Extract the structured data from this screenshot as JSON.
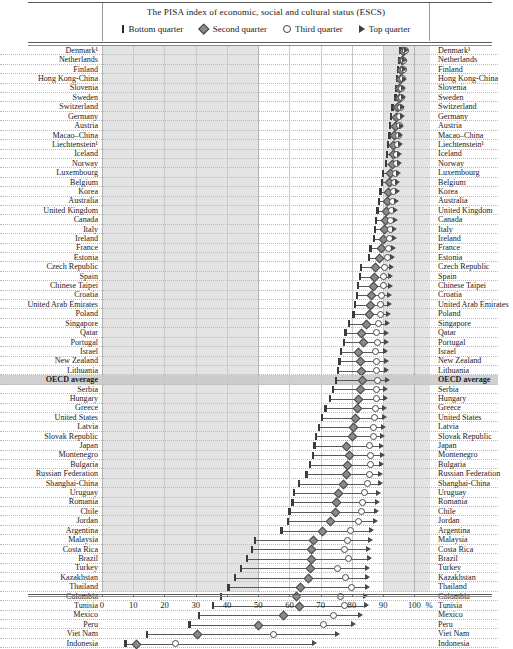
{
  "header": {
    "title": "The PISA index of economic, social and cultural status (ESCS)",
    "legend": [
      {
        "key": "bottom",
        "label": "Bottom quarter",
        "glyph": "bar-marker-icon"
      },
      {
        "key": "second",
        "label": "Second quarter",
        "glyph": "diamond-marker-icon"
      },
      {
        "key": "third",
        "label": "Third quarter",
        "glyph": "circle-marker-icon"
      },
      {
        "key": "top",
        "label": "Top quarter",
        "glyph": "triangle-marker-icon"
      }
    ]
  },
  "axis": {
    "ticks": [
      0,
      10,
      20,
      30,
      40,
      50,
      60,
      70,
      80,
      90,
      100
    ],
    "unit": "%",
    "min": 0,
    "max": 105,
    "shaded_bands": [
      [
        0,
        50
      ],
      [
        90,
        105
      ]
    ]
  },
  "colors": {
    "band_shade": "#e3e3e3",
    "highlight_row": "#c8c8c8",
    "marker_dark": "#4a4a4a",
    "marker_fill": "#8a8a8a",
    "grid": "#c9c9c9"
  },
  "chart_data": {
    "type": "scatter",
    "title": "The PISA index of economic, social and cultural status (ESCS)",
    "xlabel": "%",
    "ylabel": "",
    "xlim": [
      0,
      105
    ],
    "grid": true,
    "legend_position": "top",
    "series": [
      {
        "name": "Bottom quarter",
        "marker": "bar"
      },
      {
        "name": "Second quarter",
        "marker": "diamond"
      },
      {
        "name": "Third quarter",
        "marker": "circle"
      },
      {
        "name": "Top quarter",
        "marker": "triangle"
      }
    ],
    "categories": [
      "Denmark¹",
      "Netherlands",
      "Finland",
      "Hong Kong-China",
      "Slovenia",
      "Sweden",
      "Switzerland",
      "Germany",
      "Austria",
      "Macao–China",
      "Liechtenstein¹",
      "Iceland",
      "Norway",
      "Luxembourg",
      "Belgium",
      "Korea",
      "Australia",
      "United Kingdom",
      "Canada",
      "Italy",
      "Ireland",
      "France",
      "Estonia",
      "Czech Republic",
      "Spain",
      "Chinese Taipei",
      "Croatia",
      "United Arab Emirates",
      "Poland",
      "Singapore",
      "Qatar",
      "Portugal",
      "Israel",
      "New Zealand",
      "Lithuania",
      "OECD average",
      "Serbia",
      "Hungary",
      "Greece",
      "United States",
      "Latvia",
      "Slovak Republic",
      "Japan",
      "Montenegro",
      "Bulgaria",
      "Russian Federation",
      "Shanghai-China",
      "Uruguay",
      "Romania",
      "Chile",
      "Jordan",
      "Argentina",
      "Malaysia",
      "Costa Rica",
      "Brazil",
      "Turkey",
      "Kazakhstan",
      "Thailand",
      "Colombia",
      "Tunisia",
      "Mexico",
      "Peru",
      "Viet Nam",
      "Indonesia"
    ],
    "rows": [
      {
        "category": "Denmark¹",
        "bottom": 95.5,
        "second": 96.5,
        "third": 97.0,
        "top": 97.5
      },
      {
        "category": "Netherlands",
        "bottom": 95.0,
        "second": 96.0,
        "third": 96.5,
        "top": 97.0
      },
      {
        "category": "Finland",
        "bottom": 94.8,
        "second": 95.8,
        "third": 96.4,
        "top": 97.0
      },
      {
        "category": "Hong Kong-China",
        "bottom": 94.5,
        "second": 95.5,
        "third": 96.2,
        "top": 96.8
      },
      {
        "category": "Slovenia",
        "bottom": 94.2,
        "second": 95.2,
        "third": 96.0,
        "top": 96.6
      },
      {
        "category": "Sweden",
        "bottom": 94.0,
        "second": 95.0,
        "third": 95.8,
        "top": 96.5
      },
      {
        "category": "Switzerland",
        "bottom": 93.0,
        "second": 94.5,
        "third": 95.5,
        "top": 96.3
      },
      {
        "category": "Germany",
        "bottom": 92.6,
        "second": 94.2,
        "third": 95.3,
        "top": 96.2
      },
      {
        "category": "Austria",
        "bottom": 92.2,
        "second": 93.9,
        "third": 95.1,
        "top": 96.0
      },
      {
        "category": "Macao–China",
        "bottom": 92.0,
        "second": 93.6,
        "third": 94.8,
        "top": 95.8
      },
      {
        "category": "Liechtenstein¹",
        "bottom": 91.6,
        "second": 93.3,
        "third": 94.6,
        "top": 95.6
      },
      {
        "category": "Iceland",
        "bottom": 91.2,
        "second": 93.0,
        "third": 94.4,
        "top": 95.4
      },
      {
        "category": "Norway",
        "bottom": 91.0,
        "second": 92.8,
        "third": 94.2,
        "top": 95.2
      },
      {
        "category": "Luxembourg",
        "bottom": 90.0,
        "second": 92.2,
        "third": 93.8,
        "top": 95.0
      },
      {
        "category": "Belgium",
        "bottom": 89.6,
        "second": 91.8,
        "third": 93.5,
        "top": 94.8
      },
      {
        "category": "Korea",
        "bottom": 89.2,
        "second": 91.5,
        "third": 93.2,
        "top": 94.6
      },
      {
        "category": "Australia",
        "bottom": 88.6,
        "second": 91.2,
        "third": 93.0,
        "top": 94.4
      },
      {
        "category": "United Kingdom",
        "bottom": 88.2,
        "second": 90.8,
        "third": 92.8,
        "top": 94.2
      },
      {
        "category": "Canada",
        "bottom": 87.8,
        "second": 90.5,
        "third": 92.5,
        "top": 94.0
      },
      {
        "category": "Italy",
        "bottom": 87.4,
        "second": 90.2,
        "third": 92.3,
        "top": 93.8
      },
      {
        "category": "Ireland",
        "bottom": 87.0,
        "second": 89.8,
        "third": 92.0,
        "top": 93.6
      },
      {
        "category": "France",
        "bottom": 86.0,
        "second": 89.2,
        "third": 91.6,
        "top": 93.4
      },
      {
        "category": "Estonia",
        "bottom": 85.5,
        "second": 88.8,
        "third": 91.3,
        "top": 93.2
      },
      {
        "category": "Czech Republic",
        "bottom": 83.0,
        "second": 87.5,
        "third": 90.5,
        "top": 92.8
      },
      {
        "category": "Spain",
        "bottom": 82.5,
        "second": 87.0,
        "third": 90.2,
        "top": 92.6
      },
      {
        "category": "Chinese Taipei",
        "bottom": 82.0,
        "second": 86.6,
        "third": 90.0,
        "top": 92.4
      },
      {
        "category": "Croatia",
        "bottom": 81.6,
        "second": 86.2,
        "third": 89.6,
        "top": 92.2
      },
      {
        "category": "United Arab Emirates",
        "bottom": 81.0,
        "second": 85.8,
        "third": 89.3,
        "top": 92.0
      },
      {
        "category": "Poland",
        "bottom": 80.5,
        "second": 85.4,
        "third": 89.0,
        "top": 91.8
      },
      {
        "category": "Singapore",
        "bottom": 79.0,
        "second": 84.5,
        "third": 88.5,
        "top": 91.5
      },
      {
        "category": "Qatar",
        "bottom": 78.0,
        "second": 83.0,
        "third": 88.0,
        "top": 91.2
      },
      {
        "category": "Portugal",
        "bottom": 77.5,
        "second": 83.5,
        "third": 88.2,
        "top": 91.3
      },
      {
        "category": "Israel",
        "bottom": 76.5,
        "second": 82.0,
        "third": 87.5,
        "top": 91.0
      },
      {
        "category": "New Zealand",
        "bottom": 76.0,
        "second": 82.5,
        "third": 87.8,
        "top": 91.1
      },
      {
        "category": "Lithuania",
        "bottom": 75.5,
        "second": 83.0,
        "third": 88.0,
        "top": 91.2
      },
      {
        "category": "OECD average",
        "bottom": 75.0,
        "second": 83.2,
        "third": 88.3,
        "top": 91.4
      },
      {
        "category": "Serbia",
        "bottom": 74.0,
        "second": 82.5,
        "third": 88.0,
        "top": 91.0
      },
      {
        "category": "Hungary",
        "bottom": 73.0,
        "second": 82.0,
        "third": 87.8,
        "top": 90.8
      },
      {
        "category": "Greece",
        "bottom": 71.5,
        "second": 81.5,
        "third": 87.5,
        "top": 90.6
      },
      {
        "category": "United States",
        "bottom": 70.5,
        "second": 81.0,
        "third": 87.2,
        "top": 90.4
      },
      {
        "category": "Latvia",
        "bottom": 69.5,
        "second": 80.5,
        "third": 87.0,
        "top": 90.2
      },
      {
        "category": "Slovak Republic",
        "bottom": 68.5,
        "second": 80.0,
        "third": 86.8,
        "top": 90.0
      },
      {
        "category": "Japan",
        "bottom": 68.0,
        "second": 78.0,
        "third": 85.5,
        "top": 89.5
      },
      {
        "category": "Montenegro",
        "bottom": 67.5,
        "second": 79.0,
        "third": 86.0,
        "top": 89.8
      },
      {
        "category": "Bulgaria",
        "bottom": 66.5,
        "second": 78.5,
        "third": 85.8,
        "top": 89.6
      },
      {
        "category": "Russian Federation",
        "bottom": 65.5,
        "second": 78.0,
        "third": 85.5,
        "top": 89.4
      },
      {
        "category": "Shanghai-China",
        "bottom": 63.0,
        "second": 77.0,
        "third": 85.0,
        "top": 89.2
      },
      {
        "category": "Uruguay",
        "bottom": 61.5,
        "second": 75.5,
        "third": 84.0,
        "top": 88.5
      },
      {
        "category": "Romania",
        "bottom": 61.0,
        "second": 75.0,
        "third": 83.5,
        "top": 88.2
      },
      {
        "category": "Chile",
        "bottom": 60.0,
        "second": 74.5,
        "third": 83.0,
        "top": 88.0
      },
      {
        "category": "Jordan",
        "bottom": 59.5,
        "second": 73.0,
        "third": 82.0,
        "top": 87.5
      },
      {
        "category": "Argentina",
        "bottom": 57.5,
        "second": 70.5,
        "third": 79.5,
        "top": 86.5
      },
      {
        "category": "Malaysia",
        "bottom": 49.0,
        "second": 67.5,
        "third": 78.5,
        "top": 86.0
      },
      {
        "category": "Costa Rica",
        "bottom": 48.0,
        "second": 67.0,
        "third": 77.5,
        "top": 85.5
      },
      {
        "category": "Brazil",
        "bottom": 46.5,
        "second": 67.0,
        "third": 79.0,
        "top": 85.8
      },
      {
        "category": "Turkey",
        "bottom": 44.5,
        "second": 66.5,
        "third": 75.5,
        "top": 85.0
      },
      {
        "category": "Kazakhstan",
        "bottom": 42.5,
        "second": 66.0,
        "third": 78.0,
        "top": 85.2
      },
      {
        "category": "Thailand",
        "bottom": 40.5,
        "second": 63.5,
        "third": 80.0,
        "top": 85.0
      },
      {
        "category": "Colombia",
        "bottom": 38.0,
        "second": 62.0,
        "third": 76.5,
        "top": 84.5
      },
      {
        "category": "Tunisia",
        "bottom": 35.5,
        "second": 63.0,
        "third": 77.5,
        "top": 84.8
      },
      {
        "category": "Mexico",
        "bottom": 31.0,
        "second": 58.0,
        "third": 74.0,
        "top": 83.0
      },
      {
        "category": "Peru",
        "bottom": 28.0,
        "second": 50.0,
        "third": 71.0,
        "top": 80.5
      },
      {
        "category": "Viet Nam",
        "bottom": 14.5,
        "second": 30.5,
        "third": 55.0,
        "top": 75.5
      },
      {
        "category": "Indonesia",
        "bottom": 7.5,
        "second": 11.0,
        "third": 23.5,
        "top": 68.0
      }
    ]
  }
}
